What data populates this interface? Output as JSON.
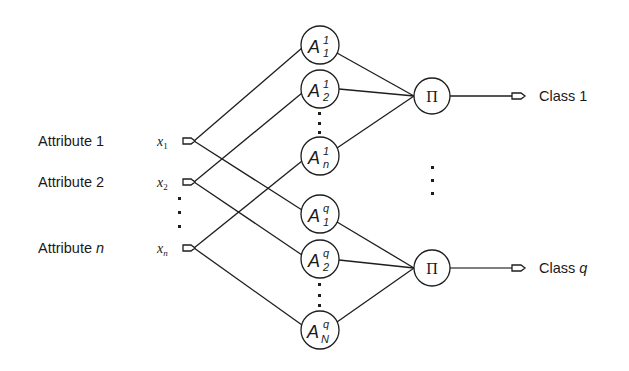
{
  "inputs": [
    {
      "attribute_label": "Attribute 1",
      "var": "x",
      "sub": "1",
      "y": 141
    },
    {
      "attribute_label": "Attribute 2",
      "var": "x",
      "sub": "2",
      "y": 182
    },
    {
      "attribute_label": "Attribute n",
      "attribute_prefix": "Attribute ",
      "attribute_italic": "n",
      "var": "x",
      "sub": "n",
      "y": 248
    }
  ],
  "membership_nodes": {
    "class_1": [
      {
        "letter": "A",
        "sup": "1",
        "sub": "1",
        "cy": 45
      },
      {
        "letter": "A",
        "sup": "1",
        "sub": "2",
        "cy": 89
      },
      {
        "letter": "A",
        "sup": "1",
        "sub": "n",
        "cy": 156
      }
    ],
    "class_q": [
      {
        "letter": "A",
        "sup": "q",
        "sub": "1",
        "cy": 214
      },
      {
        "letter": "A",
        "sup": "q",
        "sub": "2",
        "cy": 259
      },
      {
        "letter": "A",
        "sup": "q",
        "sub": "N",
        "cy": 330
      }
    ]
  },
  "product_nodes": [
    {
      "symbol": "Π",
      "cy": 96
    },
    {
      "symbol": "Π",
      "cy": 268
    }
  ],
  "outputs": [
    {
      "label": "Class 1",
      "prefix": "Class ",
      "suffix": "1",
      "suffix_italic": false
    },
    {
      "label": "Class q",
      "prefix": "Class ",
      "suffix": "q",
      "suffix_italic": true
    }
  ],
  "colors": {
    "stroke": "#1e1e1e",
    "text": "#1a1a1a",
    "background": "#ffffff"
  }
}
